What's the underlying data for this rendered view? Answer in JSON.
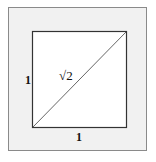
{
  "diagram": {
    "title": "",
    "shape": "unit square with diagonal",
    "labels": {
      "left_side": "1",
      "bottom_side": "1",
      "diagonal": "√2"
    },
    "colors": {
      "frame_bg": "#f1f1f1",
      "square_bg": "#ffffff",
      "stroke": "#333333"
    }
  }
}
